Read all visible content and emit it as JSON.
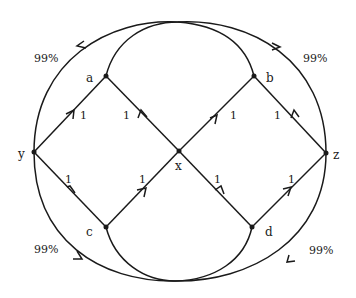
{
  "diagram": {
    "type": "network-flow-graph",
    "nodes": [
      {
        "id": "y",
        "label": "y"
      },
      {
        "id": "a",
        "label": "a"
      },
      {
        "id": "b",
        "label": "b"
      },
      {
        "id": "x",
        "label": "x"
      },
      {
        "id": "z",
        "label": "z"
      },
      {
        "id": "c",
        "label": "c"
      },
      {
        "id": "d",
        "label": "d"
      }
    ],
    "edges": [
      {
        "from": "y",
        "to": "a",
        "label": "1"
      },
      {
        "from": "x",
        "to": "a",
        "label": "1"
      },
      {
        "from": "x",
        "to": "b",
        "label": "1"
      },
      {
        "from": "z",
        "to": "b",
        "label": "1"
      },
      {
        "from": "c",
        "to": "y",
        "label": "1"
      },
      {
        "from": "c",
        "to": "x",
        "label": "1"
      },
      {
        "from": "d",
        "to": "x",
        "label": "1"
      },
      {
        "from": "d",
        "to": "z",
        "label": "1"
      },
      {
        "from": "z",
        "to": "y",
        "label": "99%",
        "path": "outer-top-left"
      },
      {
        "from": "y",
        "to": "z",
        "label": "99%",
        "path": "outer-top-right"
      },
      {
        "from": "y",
        "to": "z",
        "label": "99%",
        "path": "outer-bottom-left"
      },
      {
        "from": "z",
        "to": "y",
        "label": "99%",
        "path": "outer-bottom-right"
      }
    ]
  },
  "labels": {
    "y": "y",
    "a": "a",
    "b": "b",
    "x": "x",
    "z": "z",
    "c": "c",
    "d": "d",
    "w_ya": "1",
    "w_xa": "1",
    "w_xb": "1",
    "w_zb": "1",
    "w_cy": "1",
    "w_cx": "1",
    "w_dx": "1",
    "w_dz": "1",
    "w_tl": "99%",
    "w_tr": "99%",
    "w_bl": "99%",
    "w_br": "99%"
  }
}
